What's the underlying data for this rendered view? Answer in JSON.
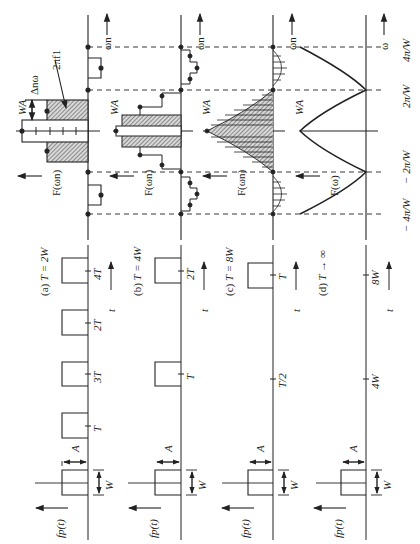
{
  "figure": {
    "orientation": "rotated 90 degrees counter-clockwise",
    "ink_color": "#222222",
    "hatch_color": "#555555",
    "panels": [
      {
        "id": "a",
        "caption_letter": "(a)",
        "caption_eq": "T = 2W",
        "time_ticks": [
          "T",
          "2T",
          "3T",
          "4T"
        ],
        "spectrum_label": "F(ωn)",
        "freq_axis": "ωn",
        "annot_height": "WA",
        "annot_spacing": "Δnω",
        "annot_area": "2πf1"
      },
      {
        "id": "b",
        "caption_letter": "(b)",
        "caption_eq": "T = 4W",
        "time_ticks": [
          "T",
          "2T"
        ],
        "spectrum_label": "F(ωn)",
        "freq_axis": "ωn",
        "annot_height": "WA"
      },
      {
        "id": "c",
        "caption_letter": "(c)",
        "caption_eq": "T = 8W",
        "time_ticks": [
          "T/2",
          "T"
        ],
        "spectrum_label": "F(ωn)",
        "freq_axis": "ωn",
        "annot_height": "WA"
      },
      {
        "id": "d",
        "caption_letter": "(d)",
        "caption_eq": "T → ∞",
        "time_ticks": [
          "4W",
          "8W"
        ],
        "spectrum_label": "F(ω)",
        "freq_axis": "ω",
        "annot_height": "WA"
      }
    ],
    "time_signal_label": "fp(t)",
    "time_axis": "t",
    "pulse_width": "W",
    "pulse_amplitude": "A",
    "freq_tick_labels": [
      "− 4π/W",
      "− 2π/W",
      "2π/W",
      "4π/W"
    ]
  }
}
